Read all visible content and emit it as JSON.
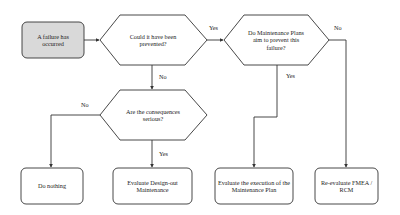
{
  "diagram": {
    "type": "flowchart",
    "nodes": {
      "start": {
        "text": "A failure has occurred",
        "shape": "rounded-rect",
        "fill": "#d9d9d9"
      },
      "q_prevented": {
        "text": "Could it have been prevented?",
        "shape": "hexagon"
      },
      "q_plans": {
        "text": "Do Maintenance Plans aim to prevent this failure?",
        "shape": "hexagon"
      },
      "q_serious": {
        "text": "Are the consequences serious?",
        "shape": "hexagon"
      },
      "do_nothing": {
        "text": "Do nothing",
        "shape": "rounded-rect"
      },
      "design_out": {
        "text": "Evaluate Design-out Maintenance",
        "shape": "rounded-rect"
      },
      "eval_execution": {
        "text": "Evaluate the execution of the Maintenance Plan",
        "shape": "rounded-rect"
      },
      "reevaluate": {
        "text": "Re-evaluate FMEA / RCM",
        "shape": "rounded-rect"
      }
    },
    "edges": [
      {
        "from": "start",
        "to": "q_prevented",
        "label": ""
      },
      {
        "from": "q_prevented",
        "to": "q_plans",
        "label": "Yes"
      },
      {
        "from": "q_prevented",
        "to": "q_serious",
        "label": "No"
      },
      {
        "from": "q_serious",
        "to": "do_nothing",
        "label": "No"
      },
      {
        "from": "q_serious",
        "to": "design_out",
        "label": "Yes"
      },
      {
        "from": "q_plans",
        "to": "eval_execution",
        "label": "Yes"
      },
      {
        "from": "q_plans",
        "to": "reevaluate",
        "label": "No"
      }
    ],
    "colors": {
      "stroke": "#333333",
      "start_fill": "#d9d9d9",
      "background": "#ffffff"
    }
  }
}
